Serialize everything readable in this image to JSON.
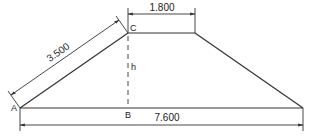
{
  "diagram": {
    "type": "trapezoid-dimension-drawing",
    "points": {
      "A": "A",
      "B": "B",
      "C": "C"
    },
    "height_label": "h",
    "dimensions": {
      "slant": "3.500",
      "top": "1.800",
      "base": "7.600"
    },
    "colors": {
      "line": "#333333",
      "background": "#ffffff"
    }
  }
}
